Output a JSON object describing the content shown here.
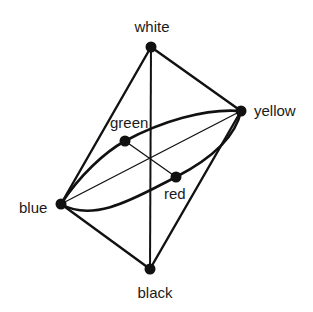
{
  "diagram": {
    "nodes": [
      {
        "id": "white",
        "label": "white",
        "x": 151,
        "y": 47
      },
      {
        "id": "yellow",
        "label": "yellow",
        "x": 241,
        "y": 111
      },
      {
        "id": "green",
        "label": "green",
        "x": 125,
        "y": 141
      },
      {
        "id": "red",
        "label": "red",
        "x": 176,
        "y": 177
      },
      {
        "id": "blue",
        "label": "blue",
        "x": 61,
        "y": 204
      },
      {
        "id": "black",
        "label": "black",
        "x": 150,
        "y": 269
      }
    ],
    "edges": [
      {
        "from": "white",
        "to": "yellow"
      },
      {
        "from": "white",
        "to": "blue"
      },
      {
        "from": "white",
        "to": "black"
      },
      {
        "from": "black",
        "to": "yellow"
      },
      {
        "from": "black",
        "to": "blue"
      },
      {
        "from": "blue",
        "to": "yellow"
      },
      {
        "from": "green",
        "to": "red"
      }
    ],
    "ellipse": {
      "through": [
        "blue",
        "green",
        "yellow",
        "red"
      ]
    },
    "colors": {
      "stroke": "#111111",
      "node": "#111111",
      "background": "#ffffff"
    }
  }
}
